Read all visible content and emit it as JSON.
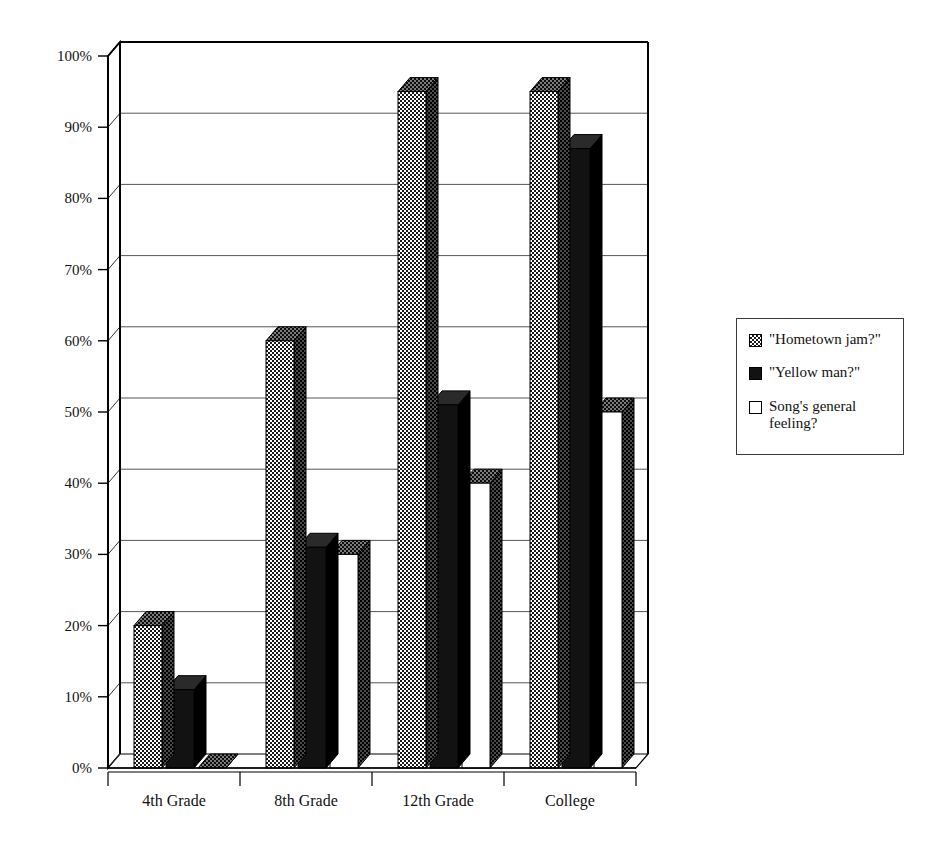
{
  "chart_data": {
    "type": "bar",
    "title": "",
    "subtitle": "",
    "xlabel": "",
    "ylabel": "",
    "categories": [
      "4th Grade",
      "8th Grade",
      "12th Grade",
      "College"
    ],
    "series": [
      {
        "name": "\"Hometown jam?\"",
        "values": [
          20,
          60,
          95,
          95
        ],
        "fill": "checkered"
      },
      {
        "name": "\"Yellow man?\"",
        "values": [
          11,
          31,
          51,
          87
        ],
        "fill": "solid-black"
      },
      {
        "name": "Song's general feeling?",
        "values": [
          0,
          30,
          40,
          50
        ],
        "fill": "white"
      }
    ],
    "ylim": [
      0,
      100
    ],
    "yticks": [
      0,
      10,
      20,
      30,
      40,
      50,
      60,
      70,
      80,
      90,
      100
    ],
    "ytick_labels": [
      "0%",
      "10%",
      "20%",
      "30%",
      "40%",
      "50%",
      "60%",
      "70%",
      "80%",
      "90%",
      "100%"
    ],
    "grid": true,
    "grid_axis": "y",
    "legend_position": "right",
    "style": "3d-bar",
    "value_unit": "%"
  },
  "legend": {
    "items": [
      {
        "label": "\"Hometown jam?\"",
        "swatch": "checkered-swatch"
      },
      {
        "label": "\"Yellow man?\"",
        "swatch": "black-swatch"
      },
      {
        "label": "Song's general\nfeeling?",
        "swatch": "white-swatch"
      }
    ]
  },
  "colors": {
    "bar_outline": "#000000",
    "solid_series": "#121212",
    "white_series": "#ffffff",
    "checker_dark": "#1a1a1a",
    "axis": "#000000",
    "gridline": "#555555",
    "background": "#ffffff"
  }
}
